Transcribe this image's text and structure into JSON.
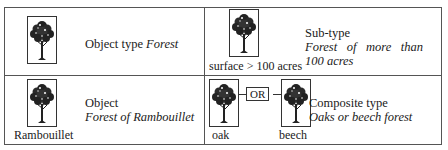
{
  "cells": [
    {
      "id": "object-type",
      "title": "Object type ",
      "title_italic": "Forest",
      "tree_caption": ""
    },
    {
      "id": "sub-type",
      "title": "Sub-type",
      "subtitle_line1": "Forest of more than",
      "subtitle_line2": "100 acres",
      "tree_caption": "surface > 100 acres"
    },
    {
      "id": "object",
      "title": "Object",
      "subtitle": "Forest of Rambouillet",
      "tree_caption": "Rambouillet"
    },
    {
      "id": "composite-type",
      "title": "Composite type",
      "subtitle": "Oaks or beech forest",
      "tree_captions": [
        "oak",
        "beech"
      ],
      "operator": "OR"
    }
  ],
  "icons": {
    "tree": "tree-icon"
  }
}
